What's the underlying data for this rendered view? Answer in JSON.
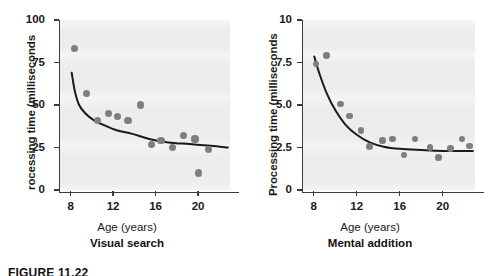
{
  "figure": {
    "caption": "FIGURE 11.22",
    "panels": [
      {
        "id": "visual-search",
        "title": "Visual search",
        "xlabel": "Age (years)",
        "ylabel": "Processing time (milliseconds)",
        "ylabel_visible": "rocessing time (milliseconds"
      },
      {
        "id": "mental-addition",
        "title": "Mental addition",
        "xlabel": "Age (years)",
        "ylabel": "Processing time (milliseconds)",
        "ylabel_visible": "Processing time (milliseconds"
      }
    ]
  },
  "colors": {
    "plot_background": "#ededed",
    "point": "#7e7e7e",
    "curve": "#1a1a1a",
    "axis": "#3b3b3b",
    "text": "#1a1a1a",
    "page_background": "#ffffff"
  },
  "chart_data": [
    {
      "type": "scatter",
      "title": "Visual search",
      "xlabel": "Age (years)",
      "ylabel": "Processing time (milliseconds)",
      "xlim": [
        7.0,
        23.0
      ],
      "ylim": [
        0,
        100
      ],
      "xticks": [
        8,
        12,
        16,
        20
      ],
      "yticks": [
        0,
        25,
        50,
        75,
        100
      ],
      "xticklabels": [
        "8",
        "12",
        "16",
        "20"
      ],
      "yticklabels": [
        "0",
        "25",
        "50",
        "75",
        "100"
      ],
      "grid": false,
      "legend": "none",
      "points": [
        {
          "x": 8.4,
          "y": 83
        },
        {
          "x": 9.5,
          "y": 57
        },
        {
          "x": 10.5,
          "y": 41
        },
        {
          "x": 11.6,
          "y": 45
        },
        {
          "x": 12.4,
          "y": 43
        },
        {
          "x": 13.4,
          "y": 41
        },
        {
          "x": 14.6,
          "y": 50
        },
        {
          "x": 15.6,
          "y": 27
        },
        {
          "x": 16.5,
          "y": 29
        },
        {
          "x": 17.6,
          "y": 25
        },
        {
          "x": 18.6,
          "y": 32
        },
        {
          "x": 19.7,
          "y": 30
        },
        {
          "x": 20.0,
          "y": 10
        },
        {
          "x": 21.0,
          "y": 24
        }
      ],
      "fit_curve": {
        "description": "decreasing exponential-decay fit leveling near 25 ms",
        "points": [
          {
            "x": 8.1,
            "y": 69
          },
          {
            "x": 8.4,
            "y": 58
          },
          {
            "x": 8.8,
            "y": 50
          },
          {
            "x": 9.4,
            "y": 45
          },
          {
            "x": 10.2,
            "y": 41
          },
          {
            "x": 11.2,
            "y": 38
          },
          {
            "x": 12.4,
            "y": 35
          },
          {
            "x": 13.8,
            "y": 33
          },
          {
            "x": 15.4,
            "y": 30
          },
          {
            "x": 17.2,
            "y": 28
          },
          {
            "x": 19.2,
            "y": 27
          },
          {
            "x": 21.2,
            "y": 26
          },
          {
            "x": 22.8,
            "y": 25
          }
        ]
      }
    },
    {
      "type": "scatter",
      "title": "Mental addition",
      "xlabel": "Age (years)",
      "ylabel": "Processing time (milliseconds)",
      "xlim": [
        7.0,
        23.0
      ],
      "ylim": [
        0,
        10
      ],
      "xticks": [
        8,
        12,
        16,
        20
      ],
      "yticks": [
        0,
        2.5,
        5.0,
        7.5,
        10
      ],
      "xticklabels": [
        "8",
        "12",
        "16",
        "20"
      ],
      "yticklabels": [
        "0",
        "2.5",
        "5.0",
        "7.5",
        "10"
      ],
      "grid": false,
      "legend": "none",
      "points": [
        {
          "x": 8.2,
          "y": 7.4
        },
        {
          "x": 9.2,
          "y": 7.9
        },
        {
          "x": 10.5,
          "y": 5.05
        },
        {
          "x": 11.3,
          "y": 4.35
        },
        {
          "x": 12.4,
          "y": 3.5
        },
        {
          "x": 13.2,
          "y": 2.55
        },
        {
          "x": 14.4,
          "y": 2.9
        },
        {
          "x": 15.3,
          "y": 3.0
        },
        {
          "x": 16.4,
          "y": 2.05
        },
        {
          "x": 17.4,
          "y": 3.0
        },
        {
          "x": 18.8,
          "y": 2.5
        },
        {
          "x": 19.6,
          "y": 1.9
        },
        {
          "x": 20.7,
          "y": 2.45
        },
        {
          "x": 21.8,
          "y": 3.0
        },
        {
          "x": 22.5,
          "y": 2.6
        }
      ],
      "fit_curve": {
        "description": "decreasing exponential-decay fit leveling near 2.3 ms",
        "points": [
          {
            "x": 8.05,
            "y": 7.85
          },
          {
            "x": 8.5,
            "y": 6.9
          },
          {
            "x": 9.2,
            "y": 5.7
          },
          {
            "x": 10.0,
            "y": 4.7
          },
          {
            "x": 11.0,
            "y": 3.8
          },
          {
            "x": 12.0,
            "y": 3.25
          },
          {
            "x": 13.2,
            "y": 2.8
          },
          {
            "x": 14.5,
            "y": 2.55
          },
          {
            "x": 16.0,
            "y": 2.42
          },
          {
            "x": 18.0,
            "y": 2.35
          },
          {
            "x": 20.0,
            "y": 2.3
          },
          {
            "x": 22.8,
            "y": 2.3
          }
        ]
      }
    }
  ]
}
